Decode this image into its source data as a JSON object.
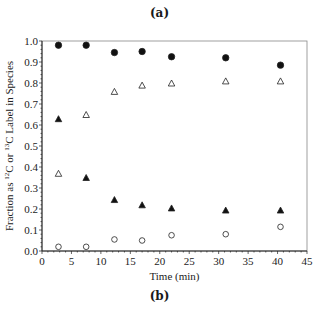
{
  "captions": {
    "top": "(a)",
    "bottom": "(b)"
  },
  "chart_data": {
    "type": "scatter",
    "title": "",
    "xlabel": "Time (min)",
    "ylabel": "Fraction as 12C or 13C Label in Species",
    "xlim": [
      0,
      45
    ],
    "ylim": [
      0,
      1.0
    ],
    "xticks": [
      0,
      5,
      10,
      15,
      20,
      25,
      30,
      35,
      40,
      45
    ],
    "yticks": [
      0.0,
      0.1,
      0.2,
      0.3,
      0.4,
      0.5,
      0.6,
      0.7,
      0.8,
      0.9,
      1.0
    ],
    "grid": false,
    "legend": null,
    "x": [
      2.8,
      7.5,
      12.3,
      17.0,
      22.0,
      31.2,
      40.5
    ],
    "series": [
      {
        "name": "filled-circle",
        "marker": "circle",
        "filled": true,
        "values": [
          0.98,
          0.98,
          0.945,
          0.95,
          0.925,
          0.92,
          0.885
        ]
      },
      {
        "name": "upper-triangle",
        "marker": "triangle",
        "filled_per_point": [
          true,
          false,
          false,
          false,
          false,
          false,
          false
        ],
        "values": [
          0.63,
          0.65,
          0.76,
          0.79,
          0.8,
          0.81,
          0.81
        ]
      },
      {
        "name": "lower-triangle",
        "marker": "triangle",
        "filled_per_point": [
          false,
          true,
          true,
          true,
          true,
          true,
          true
        ],
        "values": [
          0.37,
          0.35,
          0.245,
          0.22,
          0.205,
          0.195,
          0.195
        ]
      },
      {
        "name": "open-circle",
        "marker": "circle",
        "filled": false,
        "values": [
          0.02,
          0.02,
          0.055,
          0.05,
          0.075,
          0.08,
          0.115
        ]
      }
    ]
  }
}
